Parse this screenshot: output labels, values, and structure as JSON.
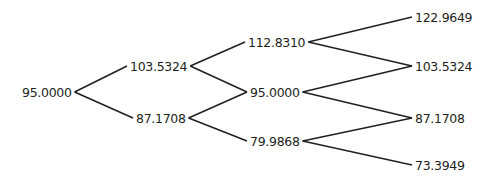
{
  "diagram": {
    "type": "binomial-tree",
    "levels": [
      [
        "95.0000"
      ],
      [
        "103.5324",
        "87.1708"
      ],
      [
        "112.8310",
        "95.0000",
        "79.9868"
      ],
      [
        "122.9649",
        "103.5324",
        "87.1708",
        "73.3949"
      ]
    ],
    "colors": {
      "line": "#231f20",
      "text": "#231f20",
      "background": "#ffffff"
    }
  }
}
